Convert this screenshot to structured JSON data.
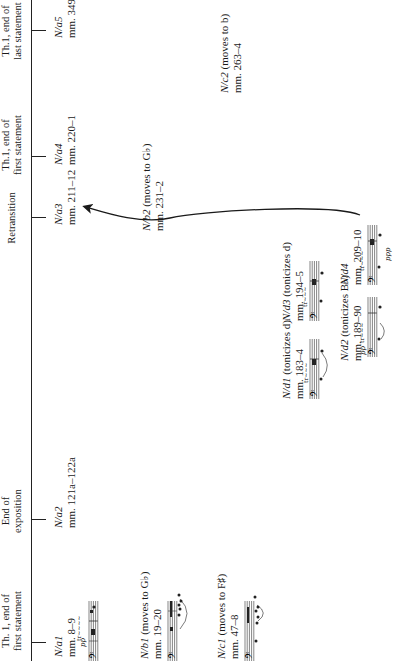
{
  "timeline": {
    "sections": [
      {
        "id": "th1-first-1",
        "line1": "Th. 1, end of",
        "line2": "first statement",
        "x": 40
      },
      {
        "id": "end-exposition",
        "line1": "End of",
        "line2": "exposition",
        "x": 150
      },
      {
        "id": "retransition",
        "line1": "Retransition",
        "line2": "",
        "x": 443
      },
      {
        "id": "th1-first-2",
        "line1": "Th.1, end of",
        "line2": "first statement",
        "x": 516
      },
      {
        "id": "th1-last",
        "line1": "Th.1, end of",
        "line2": "last statement",
        "x": 630
      }
    ],
    "ticks": [
      18,
      141,
      443,
      504,
      630
    ]
  },
  "statements": {
    "a1": {
      "name": "N/a1",
      "mm": "mm. 8–9",
      "dyn": "pp"
    },
    "a2": {
      "name": "N/a2",
      "mm": "mm. 121a–122a"
    },
    "a3": {
      "name": "N/a3",
      "mm": "mm. 211–12"
    },
    "a4": {
      "name": "N/a4",
      "mm": "mm. 220–1"
    },
    "a5": {
      "name": "N/a5",
      "mm": "mm. 349–"
    },
    "b1": {
      "name": "N/b1",
      "desc": "(moves to G♭)",
      "mm": "mm. 19–20"
    },
    "b2": {
      "name": "N/b2",
      "desc": "(moves to G♭)",
      "mm": "mm. 231–2"
    },
    "c1": {
      "name": "N/c1",
      "desc": "(moves to F♯)",
      "mm": "mm. 47–8"
    },
    "c2": {
      "name": "N/c2",
      "desc": "(moves to b)",
      "mm": "mm. 263–4"
    },
    "d1": {
      "name": "N/d1",
      "desc": "(tonicizes d)",
      "mm": "mm. 183–4"
    },
    "d2": {
      "name": "N/d2",
      "desc": "(tonicizes B♭)",
      "mm": "mm. 189–90",
      "dyn": "pp"
    },
    "d3": {
      "name": "N/d3",
      "desc": "(tonicizes d)",
      "mm": "mm. 194–5"
    },
    "d4": {
      "name": "N/d4",
      "mm": "mm. 209–10",
      "dyn": "ppp"
    }
  },
  "arrow": {
    "from": "N/d4",
    "to": "N/a3"
  },
  "colors": {
    "ink": "#1a1a1a",
    "background": "#ffffff"
  }
}
